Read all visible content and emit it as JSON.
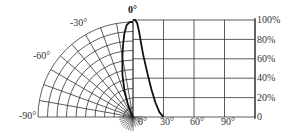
{
  "chart_data": {
    "type": "line",
    "title": "",
    "subtitle": "Radiation pattern: polar (left) and rectangular (right) plots of relative intensity vs. angle",
    "polar": {
      "angle_labels": [
        "0°",
        "-30°",
        "-60°",
        "-90°",
        "0°"
      ],
      "angle_range_deg": [
        -90,
        0
      ],
      "radial_rings": 10,
      "radial_line_step_deg": 10
    },
    "rectangular": {
      "x_tick_labels": [
        "0°",
        "30°",
        "60°",
        "90°"
      ],
      "y_tick_labels": [
        "100%",
        "80%",
        "60%",
        "40%",
        "20%",
        "0"
      ],
      "xlabel": "angle",
      "ylabel": "relative intensity",
      "xlim": [
        0,
        120
      ],
      "ylim": [
        0,
        100
      ],
      "grid": true
    },
    "series": [
      {
        "name": "relative intensity",
        "x": [
          0,
          2,
          4,
          6,
          8,
          10,
          14,
          18,
          22,
          26,
          30
        ],
        "values": [
          100,
          100,
          97,
          88,
          76,
          64,
          46,
          29,
          15,
          5,
          0
        ]
      }
    ]
  },
  "labels": {
    "top": "0°",
    "m30": "-30°",
    "m60": "-60°",
    "m90": "-90°",
    "origin": "0°",
    "x30": "30°",
    "x60": "60°",
    "x90": "90°",
    "y100": "100%",
    "y80": "80%",
    "y60": "60%",
    "y40": "40%",
    "y20": "20%",
    "y0": "0"
  }
}
